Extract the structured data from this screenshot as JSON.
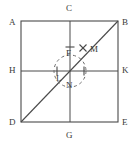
{
  "figure": {
    "type": "geometry-diagram",
    "background_color": "#ffffff",
    "stroke_color": "#4a4a4a",
    "label_color": "#3a3a3a",
    "square": {
      "name": "square-abed",
      "left": 21,
      "top": 21,
      "right": 118,
      "bottom": 122
    },
    "midlines": {
      "vertical_x": 70,
      "horizontal_y": 71
    },
    "diagonal": {
      "name": "diagonal-db",
      "from": "D",
      "to": "B",
      "x1": 21,
      "y1": 122,
      "x2": 118,
      "y2": 21
    },
    "arc": {
      "name": "dashed-arc",
      "center_x": 70,
      "center_y": 71,
      "radius": 16,
      "dash": "3 3"
    },
    "ticks": [
      {
        "name": "tick-vertical-upper",
        "x": 70,
        "y": 47,
        "orient": "horizontal",
        "size": 5
      },
      {
        "name": "tick-horizontal-left",
        "x": 57,
        "y": 71,
        "orient": "vertical",
        "size": 5
      },
      {
        "name": "tick-horizontal-right",
        "x": 84,
        "y": 71,
        "orient": "vertical",
        "size": 5
      }
    ],
    "cross_marker": {
      "name": "marker-m-cross",
      "x": 83,
      "y": 48,
      "size": 4
    },
    "labels": [
      {
        "key": "A",
        "text": "A",
        "x": 9,
        "y": 18,
        "name": "vertex-label-a"
      },
      {
        "key": "B",
        "text": "B",
        "x": 122,
        "y": 18,
        "name": "vertex-label-b"
      },
      {
        "key": "C",
        "text": "C",
        "x": 66,
        "y": 4,
        "name": "vertex-label-c"
      },
      {
        "key": "D",
        "text": "D",
        "x": 9,
        "y": 118,
        "name": "vertex-label-d"
      },
      {
        "key": "E",
        "text": "E",
        "x": 122,
        "y": 118,
        "name": "vertex-label-e"
      },
      {
        "key": "G",
        "text": "G",
        "x": 66,
        "y": 131,
        "name": "vertex-label-g"
      },
      {
        "key": "H",
        "text": "H",
        "x": 9,
        "y": 66,
        "name": "vertex-label-h"
      },
      {
        "key": "K",
        "text": "K",
        "x": 122,
        "y": 66,
        "name": "vertex-label-k"
      },
      {
        "key": "F",
        "text": "F",
        "x": 66,
        "y": 49,
        "name": "point-label-f"
      },
      {
        "key": "M",
        "text": "M",
        "x": 90,
        "y": 45,
        "name": "point-label-m"
      },
      {
        "key": "L",
        "text": "L",
        "x": 56,
        "y": 74,
        "name": "point-label-l"
      },
      {
        "key": "N",
        "text": "N",
        "x": 66,
        "y": 81,
        "name": "point-label-n"
      }
    ]
  }
}
